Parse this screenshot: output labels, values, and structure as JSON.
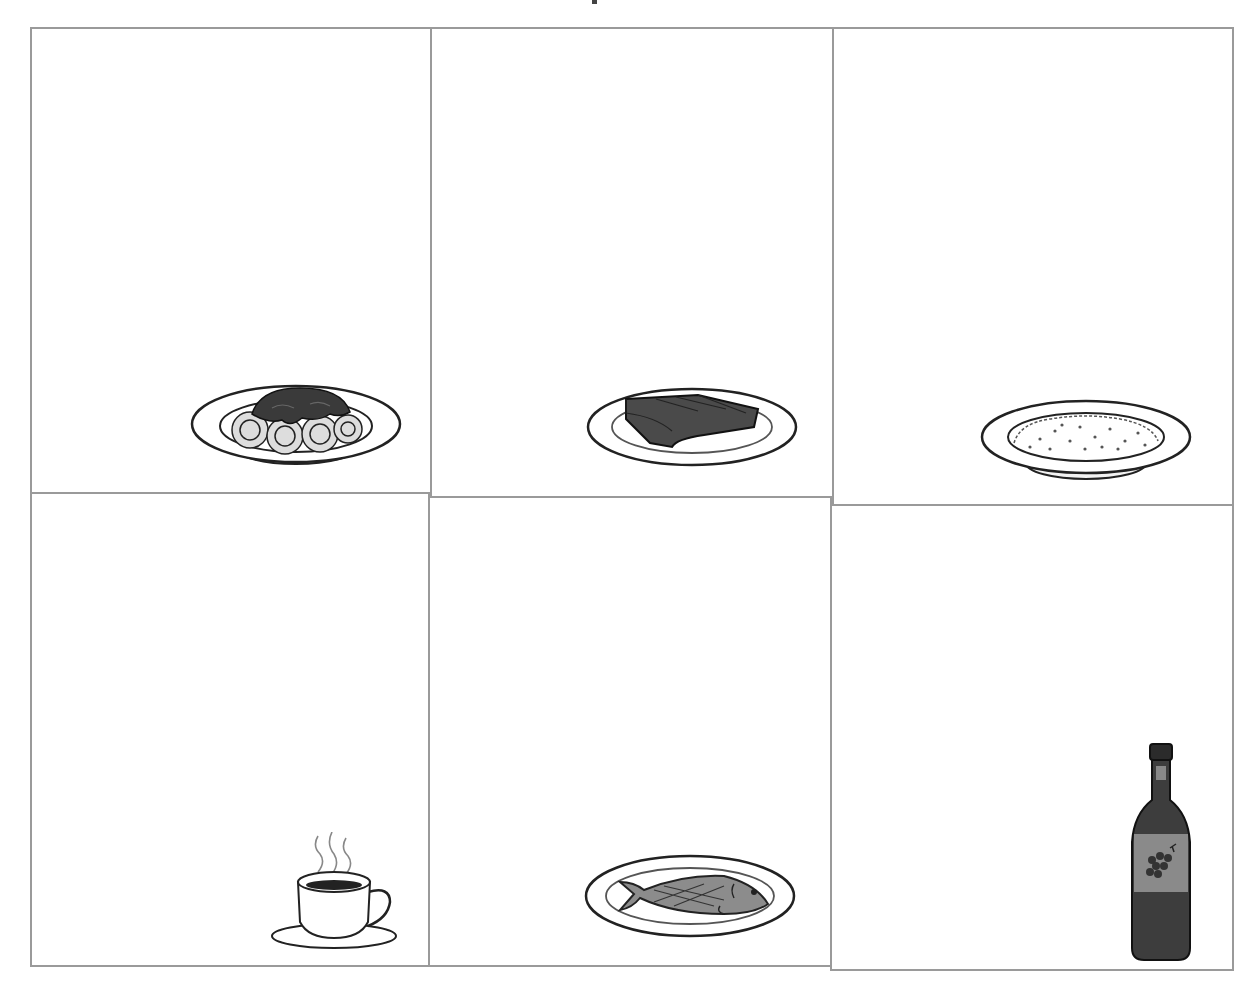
{
  "grid": {
    "rows": 2,
    "columns": 3,
    "cells": [
      {
        "position": "row1-col1",
        "item": "spaghetti-bowl-icon",
        "description": "Bowl of spaghetti with sauce"
      },
      {
        "position": "row1-col2",
        "item": "steak-plate-icon",
        "description": "Plate with steak"
      },
      {
        "position": "row1-col3",
        "item": "rice-bowl-icon",
        "description": "Bowl of rice"
      },
      {
        "position": "row2-col1",
        "item": "coffee-cup-icon",
        "description": "Steaming cup of coffee on saucer"
      },
      {
        "position": "row2-col2",
        "item": "fish-plate-icon",
        "description": "Plate with fish"
      },
      {
        "position": "row2-col3",
        "item": "wine-bottle-icon",
        "description": "Bottle of wine with grape label"
      }
    ]
  },
  "colors": {
    "grid_line": "#9a9a9a",
    "outline": "#222222",
    "sauce": "#3a3a3a",
    "steak": "#4a4a4a",
    "fish": "#8c8c8c",
    "bottle": "#3d3d3d",
    "label": "#8a8a8a"
  }
}
